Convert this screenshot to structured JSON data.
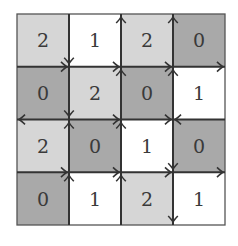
{
  "grid": {
    "rows": 4,
    "cols": 4,
    "values": [
      [
        2,
        1,
        2,
        0
      ],
      [
        0,
        2,
        0,
        1
      ],
      [
        2,
        0,
        1,
        0
      ],
      [
        0,
        1,
        2,
        1
      ]
    ],
    "colors": {
      "0": "#a9a9a9",
      "1": "#ffffff",
      "2": "#d6d6d6",
      "line": "#333333",
      "border": "#555555"
    },
    "horizontal_arrows": [
      [
        "right",
        "right",
        "right",
        "right"
      ],
      [
        "left",
        "right",
        "right",
        "left"
      ],
      [
        "right",
        "right",
        "right",
        "right"
      ]
    ],
    "vertical_arrows": [
      [
        "down",
        "down",
        "up",
        "up"
      ],
      [
        "up",
        "up",
        "up",
        "up"
      ],
      [
        "up",
        "up",
        "down",
        "down"
      ]
    ]
  },
  "cells_text": [
    [
      "2",
      "1",
      "2",
      "0"
    ],
    [
      "0",
      "2",
      "0",
      "1"
    ],
    [
      "2",
      "0",
      "1",
      "0"
    ],
    [
      "0",
      "1",
      "2",
      "1"
    ]
  ]
}
